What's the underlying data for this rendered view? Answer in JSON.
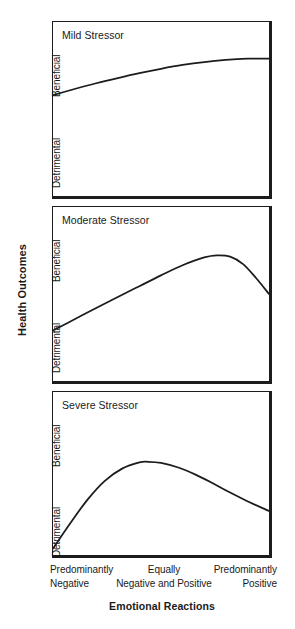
{
  "figure": {
    "yaxis_title": "Health Outcomes",
    "xaxis_title": "Emotional Reactions",
    "line_color": "#1c1c1c",
    "frame_color": "#1c1c1c",
    "background": "#ffffff"
  },
  "yaxis_ticks": {
    "high": "Beneficial",
    "low": "Detrimental"
  },
  "xaxis_ticks": [
    {
      "line1": "Predominantly",
      "line2": "Negative"
    },
    {
      "line1": "Equally",
      "line2": "Negative and Positive"
    },
    {
      "line1": "Predominantly",
      "line2": "Positive"
    }
  ],
  "panels": [
    {
      "title": "Mild Stressor"
    },
    {
      "title": "Moderate Stressor"
    },
    {
      "title": "Severe Stressor"
    }
  ],
  "chart_data": [
    {
      "type": "line",
      "title": "Mild Stressor",
      "xlabel": "Emotional Reactions",
      "ylabel": "Health Outcomes",
      "xlim": [
        0,
        1
      ],
      "ylim": [
        0,
        1
      ],
      "xtick_labels": [
        "Predominantly Negative",
        "Equally Negative and Positive",
        "Predominantly Positive"
      ],
      "xtick_positions": [
        0,
        0.5,
        1
      ],
      "ytick_labels": [
        "Detrimental",
        "Beneficial"
      ],
      "ytick_positions": [
        0.12,
        0.82
      ],
      "grid": false,
      "legend": false,
      "series": [
        {
          "name": "Mild Stressor",
          "x": [
            0.0,
            0.1,
            0.2,
            0.3,
            0.4,
            0.5,
            0.6,
            0.7,
            0.8,
            0.9,
            1.0
          ],
          "y": [
            0.58,
            0.615,
            0.648,
            0.678,
            0.706,
            0.731,
            0.753,
            0.77,
            0.782,
            0.789,
            0.79
          ]
        }
      ]
    },
    {
      "type": "line",
      "title": "Moderate Stressor",
      "xlabel": "Emotional Reactions",
      "ylabel": "Health Outcomes",
      "xlim": [
        0,
        1
      ],
      "ylim": [
        0,
        1
      ],
      "xtick_labels": [
        "Predominantly Negative",
        "Equally Negative and Positive",
        "Predominantly Positive"
      ],
      "xtick_positions": [
        0,
        0.5,
        1
      ],
      "ytick_labels": [
        "Detrimental",
        "Beneficial"
      ],
      "ytick_positions": [
        0.12,
        0.82
      ],
      "grid": false,
      "legend": false,
      "series": [
        {
          "name": "Moderate Stressor",
          "x": [
            0.0,
            0.1,
            0.2,
            0.3,
            0.4,
            0.5,
            0.6,
            0.7,
            0.76,
            0.82,
            0.88,
            0.94,
            1.0
          ],
          "y": [
            0.29,
            0.355,
            0.42,
            0.483,
            0.545,
            0.607,
            0.665,
            0.71,
            0.722,
            0.715,
            0.672,
            0.592,
            0.5
          ]
        }
      ]
    },
    {
      "type": "line",
      "title": "Severe Stressor",
      "xlabel": "Emotional Reactions",
      "ylabel": "Health Outcomes",
      "xlim": [
        0,
        1
      ],
      "ylim": [
        0,
        1
      ],
      "xtick_labels": [
        "Predominantly Negative",
        "Equally Negative and Positive",
        "Predominantly Positive"
      ],
      "xtick_positions": [
        0,
        0.5,
        1
      ],
      "ytick_labels": [
        "Detrimental",
        "Beneficial"
      ],
      "ytick_positions": [
        0.12,
        0.82
      ],
      "grid": false,
      "legend": false,
      "series": [
        {
          "name": "Severe Stressor",
          "x": [
            0.0,
            0.08,
            0.16,
            0.24,
            0.32,
            0.4,
            0.44,
            0.5,
            0.58,
            0.66,
            0.74,
            0.82,
            0.9,
            1.0
          ],
          "y": [
            0.04,
            0.195,
            0.34,
            0.455,
            0.53,
            0.568,
            0.572,
            0.565,
            0.537,
            0.493,
            0.44,
            0.383,
            0.33,
            0.27
          ]
        }
      ]
    }
  ]
}
